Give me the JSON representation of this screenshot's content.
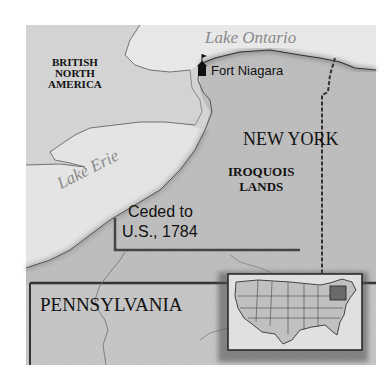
{
  "map": {
    "regions": {
      "british_north_america": [
        "BRITISH",
        "NORTH",
        "AMERICA"
      ],
      "new_york": "NEW YORK",
      "iroquois_lands": [
        "IROQUOIS",
        "LANDS"
      ],
      "pennsylvania": "PENNSYLVANIA"
    },
    "water": {
      "lake_ontario": "Lake Ontario",
      "lake_erie": "Lake Erie"
    },
    "places": {
      "fort_niagara": "Fort Niagara"
    },
    "annotations": {
      "ceded_line1": "Ceded to",
      "ceded_line2": "U.S., 1784"
    },
    "inset": {
      "description": "United States locator map with New York and Pennsylvania highlighted"
    },
    "colors": {
      "frame_bg": "#cfcfcf",
      "water": "#e6e6e6",
      "land_ny": "#b9b9b9",
      "ceded": "#bdbdbd",
      "border": "#3a3a3a"
    }
  }
}
